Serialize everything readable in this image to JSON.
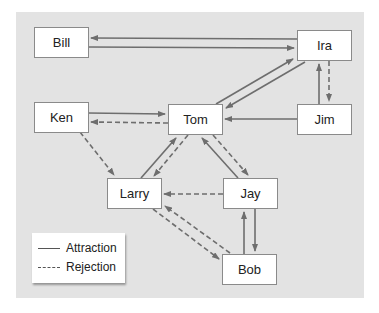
{
  "diagram": {
    "type": "sociogram",
    "colors": {
      "panel": "#e3e3e3",
      "node_fill": "#ffffff",
      "edge": "#6e6e6e"
    },
    "nodes": [
      {
        "id": "bill",
        "label": "Bill"
      },
      {
        "id": "ira",
        "label": "Ira"
      },
      {
        "id": "ken",
        "label": "Ken"
      },
      {
        "id": "tom",
        "label": "Tom"
      },
      {
        "id": "jim",
        "label": "Jim"
      },
      {
        "id": "larry",
        "label": "Larry"
      },
      {
        "id": "jay",
        "label": "Jay"
      },
      {
        "id": "bob",
        "label": "Bob"
      }
    ],
    "edges": [
      {
        "from": "Ira",
        "to": "Bill",
        "type": "attraction"
      },
      {
        "from": "Bill",
        "to": "Ira",
        "type": "attraction"
      },
      {
        "from": "Tom",
        "to": "Ira",
        "type": "attraction"
      },
      {
        "from": "Ira",
        "to": "Tom",
        "type": "attraction"
      },
      {
        "from": "Jim",
        "to": "Ira",
        "type": "attraction"
      },
      {
        "from": "Ira",
        "to": "Jim",
        "type": "rejection"
      },
      {
        "from": "Ken",
        "to": "Tom",
        "type": "attraction"
      },
      {
        "from": "Tom",
        "to": "Ken",
        "type": "rejection"
      },
      {
        "from": "Jim",
        "to": "Tom",
        "type": "attraction"
      },
      {
        "from": "Ken",
        "to": "Larry",
        "type": "rejection"
      },
      {
        "from": "Larry",
        "to": "Tom",
        "type": "attraction"
      },
      {
        "from": "Tom",
        "to": "Larry",
        "type": "rejection"
      },
      {
        "from": "Jay",
        "to": "Tom",
        "type": "attraction"
      },
      {
        "from": "Tom",
        "to": "Jay",
        "type": "rejection"
      },
      {
        "from": "Jay",
        "to": "Larry",
        "type": "rejection"
      },
      {
        "from": "Larry",
        "to": "Bob",
        "type": "rejection"
      },
      {
        "from": "Bob",
        "to": "Larry",
        "type": "rejection"
      },
      {
        "from": "Bob",
        "to": "Jay",
        "type": "attraction"
      },
      {
        "from": "Jay",
        "to": "Bob",
        "type": "attraction"
      }
    ]
  },
  "legend": {
    "attraction": "Attraction",
    "rejection": "Rejection"
  }
}
